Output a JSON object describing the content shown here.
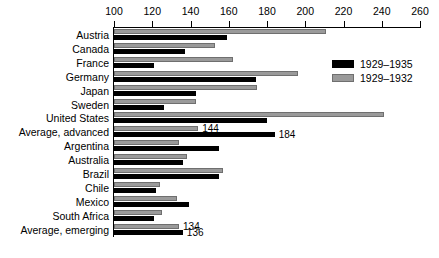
{
  "chart_data": {
    "type": "bar",
    "orientation": "horizontal",
    "title": "",
    "xlabel": "",
    "ylabel": "",
    "xlim": [
      100,
      260
    ],
    "xticks": [
      100,
      120,
      140,
      160,
      180,
      200,
      220,
      240,
      260
    ],
    "grid": false,
    "legend_position": "top-right",
    "categories": [
      "Austria",
      "Canada",
      "France",
      "Germany",
      "Japan",
      "Sweden",
      "United States",
      "Average, advanced",
      "Argentina",
      "Australia",
      "Brazil",
      "Chile",
      "Mexico",
      "South Africa",
      "Average, emerging"
    ],
    "series": [
      {
        "name": "1929–1935",
        "color": "#000000",
        "values": [
          159,
          137,
          121,
          174,
          143,
          126,
          180,
          184,
          155,
          136,
          155,
          122,
          139,
          121,
          136
        ]
      },
      {
        "name": "1929–1932",
        "color": "#9a9a9a",
        "values": [
          211,
          153,
          162,
          196,
          175,
          143,
          241,
          144,
          134,
          138,
          157,
          124,
          133,
          125,
          134
        ]
      }
    ],
    "data_labels": [
      {
        "category": "Average, advanced",
        "series": "1929–1935",
        "text": "184"
      },
      {
        "category": "Average, advanced",
        "series": "1929–1932",
        "text": "144"
      },
      {
        "category": "Average, emerging",
        "series": "1929–1932",
        "text": "134"
      },
      {
        "category": "Average, emerging",
        "series": "1929–1935",
        "text": "136"
      }
    ]
  },
  "legend": {
    "items": [
      {
        "label": "1929–1935",
        "swatch": "black"
      },
      {
        "label": "1929–1932",
        "swatch": "gray"
      }
    ]
  }
}
